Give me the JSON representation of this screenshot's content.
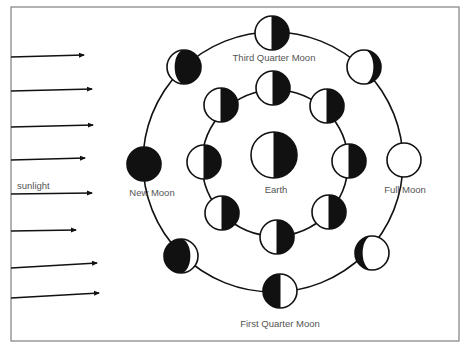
{
  "diagram": {
    "type": "moon-phases",
    "frame": {
      "x": 11,
      "y": 7,
      "width": 448,
      "height": 334,
      "color": "#808080"
    },
    "colors": {
      "stroke": "#111111",
      "dark": "#111111",
      "light": "#ffffff",
      "label": "#555555"
    },
    "sunlight": {
      "label": "sunlight",
      "arrows": [
        {
          "y1": 57,
          "y2": 55,
          "x2": 84
        },
        {
          "y1": 91,
          "y2": 89,
          "x2": 92
        },
        {
          "y1": 127,
          "y2": 125,
          "x2": 93
        },
        {
          "y1": 160,
          "y2": 158,
          "x2": 85
        },
        {
          "y1": 194,
          "y2": 193,
          "x2": 92
        },
        {
          "y1": 231,
          "y2": 230,
          "x2": 76
        },
        {
          "y1": 268,
          "y2": 263,
          "x2": 97
        },
        {
          "y1": 298,
          "y2": 293,
          "x2": 99
        }
      ]
    },
    "earth": {
      "label": "Earth",
      "cx": 274,
      "cy": 155,
      "r": 23,
      "phase": "half-right-dark"
    },
    "outer_orbit": {
      "cx": 273,
      "cy": 162,
      "r": 130
    },
    "inner_orbit": {
      "cx": 275,
      "cy": 163,
      "r": 73
    },
    "outer_moons": [
      {
        "name": "third-quarter",
        "label": "Third Quarter Moon",
        "cx": 272,
        "cy": 33,
        "phase": "half-right-dark"
      },
      {
        "name": "waning-crescent",
        "label": "",
        "cx": 184,
        "cy": 67,
        "phase": "gibbous-dark-right"
      },
      {
        "name": "new",
        "label": "New Moon",
        "cx": 144,
        "cy": 164,
        "phase": "full-dark"
      },
      {
        "name": "waxing-crescent",
        "label": "",
        "cx": 181,
        "cy": 256,
        "phase": "gibbous-dark-left"
      },
      {
        "name": "first-quarter",
        "label": "First Quarter Moon",
        "cx": 280,
        "cy": 291,
        "phase": "half-left-dark"
      },
      {
        "name": "waxing-gibbous",
        "label": "",
        "cx": 372,
        "cy": 253,
        "phase": "crescent-dark-left"
      },
      {
        "name": "full",
        "label": "Full Moon",
        "cx": 404,
        "cy": 160,
        "phase": "full-light"
      },
      {
        "name": "waning-gibbous",
        "label": "",
        "cx": 364,
        "cy": 67,
        "phase": "crescent-dark-right"
      }
    ],
    "inner_moons": [
      {
        "cx": 273,
        "cy": 88
      },
      {
        "cx": 327,
        "cy": 106
      },
      {
        "cx": 349,
        "cy": 161
      },
      {
        "cx": 329,
        "cy": 212
      },
      {
        "cx": 277,
        "cy": 237
      },
      {
        "cx": 222,
        "cy": 213
      },
      {
        "cx": 204,
        "cy": 162
      },
      {
        "cx": 221,
        "cy": 105
      }
    ],
    "labels": {
      "third_quarter": {
        "text": "Third Quarter Moon",
        "x": 274,
        "y": 61
      },
      "first_quarter": {
        "text": "First Quarter Moon",
        "x": 280,
        "y": 327
      },
      "new_moon": {
        "text": "New Moon",
        "x": 152,
        "y": 196
      },
      "full_moon": {
        "text": "Full Moon",
        "x": 405,
        "y": 193
      },
      "earth": {
        "text": "Earth",
        "x": 276,
        "y": 193
      },
      "sunlight": {
        "text": "sunlight",
        "x": 17,
        "y": 189
      }
    }
  }
}
